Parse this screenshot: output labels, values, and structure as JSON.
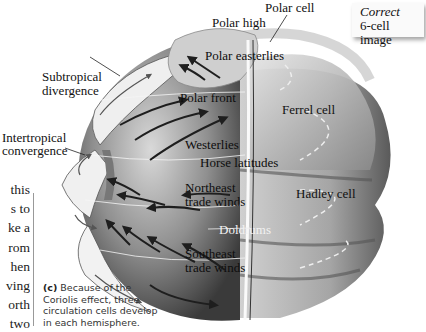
{
  "figure": {
    "note_box": {
      "line1_italic": "Correct",
      "line2": "6-cell image"
    },
    "labels": {
      "polar_cell": "Polar cell",
      "polar_high": "Polar high",
      "polar_easterlies": "Polar easterlies",
      "subtropical_divergence_1": "Subtropical",
      "subtropical_divergence_2": "divergence",
      "polar_front": "Polar front",
      "ferrel_cell": "Ferrel cell",
      "intertropical_convergence_1": "Intertropical",
      "intertropical_convergence_2": "convergence",
      "westerlies": "Westerlies",
      "horse_latitudes": "Horse latitudes",
      "northeast_trade_winds_1": "Northeast",
      "northeast_trade_winds_2": "trade winds",
      "hadley_cell": "Hadley cell",
      "doldrums": "Doldrums",
      "southeast_trade_winds_1": "Southeast",
      "southeast_trade_winds_2": "trade winds"
    },
    "caption": {
      "tag": "(c)",
      "line1": " Because of the",
      "line2": "Coriolis effect, three",
      "line3": "circulation cells develop",
      "line4": "in each hemisphere."
    },
    "body_text_fragments": [
      "this",
      "s to",
      "ke a",
      "rom",
      "hen",
      "ving",
      "orth",
      "two"
    ],
    "colors": {
      "globe_dark": "#3a3a3a",
      "globe_light": "#d8d8d8",
      "cell_shell": "#9a9a9a",
      "arrow": "#1e1e1e"
    }
  }
}
